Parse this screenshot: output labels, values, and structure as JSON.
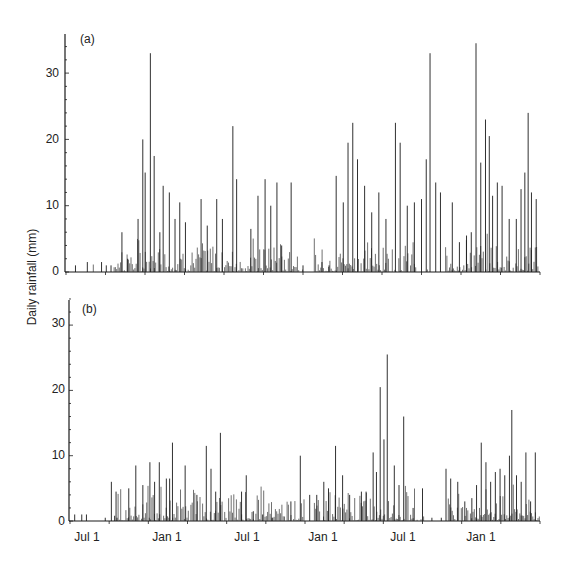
{
  "figure": {
    "ylabel": "Daily rainfall (mm)",
    "panels": [
      {
        "tag": "(a)",
        "yticks": [
          "0",
          "10",
          "20",
          "30"
        ]
      },
      {
        "tag": "(b)",
        "yticks": [
          "0",
          "10",
          "20",
          "30"
        ]
      }
    ],
    "xticks": [
      "Jul 1",
      "Jan 1",
      "Jul 1",
      "Jan 1",
      "Jul 1",
      "Jan 1"
    ],
    "line_color": "#1a1a1a"
  },
  "chart_data": [
    {
      "type": "bar",
      "title": "(a)",
      "xlabel": "",
      "ylabel": "Daily rainfall (mm)",
      "ylim": [
        0,
        35
      ],
      "grid": false,
      "x_tick_labels": [
        "Jul 1",
        "Jan 1",
        "Jul 1",
        "Jan 1",
        "Jul 1",
        "Jan 1"
      ],
      "description": "Daily rainfall time series over ~3 years (May to May); wet season roughly Sep-Apr, dry Jun-Aug.",
      "peaks": [
        {
          "x_frac": 0.02,
          "value": 1
        },
        {
          "x_frac": 0.045,
          "value": 1.5
        },
        {
          "x_frac": 0.075,
          "value": 1.5
        },
        {
          "x_frac": 0.085,
          "value": 1
        },
        {
          "x_frac": 0.095,
          "value": 1
        },
        {
          "x_frac": 0.118,
          "value": 6
        },
        {
          "x_frac": 0.13,
          "value": 2
        },
        {
          "x_frac": 0.152,
          "value": 8
        },
        {
          "x_frac": 0.162,
          "value": 20
        },
        {
          "x_frac": 0.167,
          "value": 15
        },
        {
          "x_frac": 0.178,
          "value": 33
        },
        {
          "x_frac": 0.186,
          "value": 17.5
        },
        {
          "x_frac": 0.198,
          "value": 6
        },
        {
          "x_frac": 0.205,
          "value": 13
        },
        {
          "x_frac": 0.218,
          "value": 12
        },
        {
          "x_frac": 0.23,
          "value": 8
        },
        {
          "x_frac": 0.24,
          "value": 10.5
        },
        {
          "x_frac": 0.252,
          "value": 7.5
        },
        {
          "x_frac": 0.285,
          "value": 11
        },
        {
          "x_frac": 0.298,
          "value": 7
        },
        {
          "x_frac": 0.318,
          "value": 11
        },
        {
          "x_frac": 0.33,
          "value": 8
        },
        {
          "x_frac": 0.352,
          "value": 22
        },
        {
          "x_frac": 0.36,
          "value": 14
        },
        {
          "x_frac": 0.39,
          "value": 6.5
        },
        {
          "x_frac": 0.405,
          "value": 11.5
        },
        {
          "x_frac": 0.42,
          "value": 14
        },
        {
          "x_frac": 0.432,
          "value": 10
        },
        {
          "x_frac": 0.445,
          "value": 13.5
        },
        {
          "x_frac": 0.455,
          "value": 4
        },
        {
          "x_frac": 0.475,
          "value": 13.5
        },
        {
          "x_frac": 0.5,
          "value": 1
        },
        {
          "x_frac": 0.54,
          "value": 1.5
        },
        {
          "x_frac": 0.555,
          "value": 1
        },
        {
          "x_frac": 0.57,
          "value": 14.5
        },
        {
          "x_frac": 0.585,
          "value": 10.5
        },
        {
          "x_frac": 0.595,
          "value": 19.5
        },
        {
          "x_frac": 0.605,
          "value": 22.5
        },
        {
          "x_frac": 0.615,
          "value": 17
        },
        {
          "x_frac": 0.63,
          "value": 13
        },
        {
          "x_frac": 0.645,
          "value": 9
        },
        {
          "x_frac": 0.66,
          "value": 12
        },
        {
          "x_frac": 0.675,
          "value": 8
        },
        {
          "x_frac": 0.695,
          "value": 22.5
        },
        {
          "x_frac": 0.705,
          "value": 19.5
        },
        {
          "x_frac": 0.72,
          "value": 10
        },
        {
          "x_frac": 0.735,
          "value": 10.5
        },
        {
          "x_frac": 0.75,
          "value": 11
        },
        {
          "x_frac": 0.76,
          "value": 17
        },
        {
          "x_frac": 0.768,
          "value": 33
        },
        {
          "x_frac": 0.78,
          "value": 13.5
        },
        {
          "x_frac": 0.79,
          "value": 12
        },
        {
          "x_frac": 0.815,
          "value": 10.5
        },
        {
          "x_frac": 0.83,
          "value": 4.5
        },
        {
          "x_frac": 0.845,
          "value": 5.5
        },
        {
          "x_frac": 0.855,
          "value": 6
        },
        {
          "x_frac": 0.865,
          "value": 34.5
        },
        {
          "x_frac": 0.875,
          "value": 16.5
        },
        {
          "x_frac": 0.885,
          "value": 23
        },
        {
          "x_frac": 0.893,
          "value": 20.5
        },
        {
          "x_frac": 0.9,
          "value": 11.5
        },
        {
          "x_frac": 0.91,
          "value": 13.5
        },
        {
          "x_frac": 0.92,
          "value": 13
        },
        {
          "x_frac": 0.935,
          "value": 8
        },
        {
          "x_frac": 0.95,
          "value": 8
        },
        {
          "x_frac": 0.96,
          "value": 12.5
        },
        {
          "x_frac": 0.968,
          "value": 15
        },
        {
          "x_frac": 0.975,
          "value": 24
        },
        {
          "x_frac": 0.982,
          "value": 12
        },
        {
          "x_frac": 0.992,
          "value": 11
        }
      ]
    },
    {
      "type": "bar",
      "title": "(b)",
      "xlabel": "",
      "ylabel": "Daily rainfall (mm)",
      "ylim": [
        0,
        35
      ],
      "grid": false,
      "x_tick_labels": [
        "Jul 1",
        "Jan 1",
        "Jul 1",
        "Jan 1",
        "Jul 1",
        "Jan 1"
      ],
      "description": "Daily rainfall time series for second site over same period; lower amounts overall.",
      "peaks": [
        {
          "x_frac": 0.01,
          "value": 1
        },
        {
          "x_frac": 0.025,
          "value": 1
        },
        {
          "x_frac": 0.035,
          "value": 1
        },
        {
          "x_frac": 0.075,
          "value": 0.5
        },
        {
          "x_frac": 0.095,
          "value": 0.8
        },
        {
          "x_frac": 0.1,
          "value": 0.5
        },
        {
          "x_frac": 0.088,
          "value": 6
        },
        {
          "x_frac": 0.098,
          "value": 4.5
        },
        {
          "x_frac": 0.125,
          "value": 5
        },
        {
          "x_frac": 0.14,
          "value": 8.5
        },
        {
          "x_frac": 0.155,
          "value": 5.5
        },
        {
          "x_frac": 0.17,
          "value": 9
        },
        {
          "x_frac": 0.18,
          "value": 6
        },
        {
          "x_frac": 0.19,
          "value": 9
        },
        {
          "x_frac": 0.205,
          "value": 6.5
        },
        {
          "x_frac": 0.212,
          "value": 6.5
        },
        {
          "x_frac": 0.218,
          "value": 12
        },
        {
          "x_frac": 0.245,
          "value": 8.5
        },
        {
          "x_frac": 0.27,
          "value": 4
        },
        {
          "x_frac": 0.29,
          "value": 11.5
        },
        {
          "x_frac": 0.3,
          "value": 8
        },
        {
          "x_frac": 0.31,
          "value": 4.5
        },
        {
          "x_frac": 0.32,
          "value": 13.5
        },
        {
          "x_frac": 0.365,
          "value": 4.5
        },
        {
          "x_frac": 0.375,
          "value": 7
        },
        {
          "x_frac": 0.39,
          "value": 1.5
        },
        {
          "x_frac": 0.41,
          "value": 1
        },
        {
          "x_frac": 0.43,
          "value": 0.5
        },
        {
          "x_frac": 0.47,
          "value": 3
        },
        {
          "x_frac": 0.49,
          "value": 10
        },
        {
          "x_frac": 0.51,
          "value": 4
        },
        {
          "x_frac": 0.525,
          "value": 4
        },
        {
          "x_frac": 0.54,
          "value": 6
        },
        {
          "x_frac": 0.55,
          "value": 5
        },
        {
          "x_frac": 0.565,
          "value": 11.5
        },
        {
          "x_frac": 0.58,
          "value": 7
        },
        {
          "x_frac": 0.595,
          "value": 4
        },
        {
          "x_frac": 0.62,
          "value": 4.5
        },
        {
          "x_frac": 0.63,
          "value": 4.5
        },
        {
          "x_frac": 0.645,
          "value": 10.5
        },
        {
          "x_frac": 0.652,
          "value": 7.5
        },
        {
          "x_frac": 0.66,
          "value": 20.5
        },
        {
          "x_frac": 0.668,
          "value": 12.5
        },
        {
          "x_frac": 0.675,
          "value": 25.5
        },
        {
          "x_frac": 0.69,
          "value": 8.5
        },
        {
          "x_frac": 0.7,
          "value": 5.5
        },
        {
          "x_frac": 0.71,
          "value": 16
        },
        {
          "x_frac": 0.73,
          "value": 2
        },
        {
          "x_frac": 0.75,
          "value": 5
        },
        {
          "x_frac": 0.77,
          "value": 0.5
        },
        {
          "x_frac": 0.79,
          "value": 0.5
        },
        {
          "x_frac": 0.8,
          "value": 8
        },
        {
          "x_frac": 0.81,
          "value": 6.5
        },
        {
          "x_frac": 0.825,
          "value": 6
        },
        {
          "x_frac": 0.84,
          "value": 3
        },
        {
          "x_frac": 0.855,
          "value": 3.5
        },
        {
          "x_frac": 0.865,
          "value": 5.5
        },
        {
          "x_frac": 0.875,
          "value": 12
        },
        {
          "x_frac": 0.885,
          "value": 9
        },
        {
          "x_frac": 0.895,
          "value": 6
        },
        {
          "x_frac": 0.905,
          "value": 7.5
        },
        {
          "x_frac": 0.915,
          "value": 8
        },
        {
          "x_frac": 0.925,
          "value": 7
        },
        {
          "x_frac": 0.935,
          "value": 10
        },
        {
          "x_frac": 0.94,
          "value": 17
        },
        {
          "x_frac": 0.95,
          "value": 7
        },
        {
          "x_frac": 0.96,
          "value": 6
        },
        {
          "x_frac": 0.97,
          "value": 10.5
        },
        {
          "x_frac": 0.98,
          "value": 3
        },
        {
          "x_frac": 0.99,
          "value": 10.5
        }
      ]
    }
  ]
}
